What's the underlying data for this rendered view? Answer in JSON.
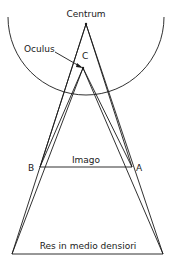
{
  "diagram": {
    "type": "optics-ray-diagram",
    "labels": {
      "centrum": "Centrum",
      "oculus": "Oculus",
      "point_c": "C",
      "imago": "Imago",
      "point_a": "A",
      "point_b": "B",
      "res": "Res in medio densiori"
    },
    "colors": {
      "line": "#1a1a1a",
      "background": "#ffffff"
    }
  }
}
